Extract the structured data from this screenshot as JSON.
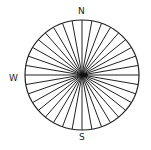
{
  "diagram": {
    "type": "compass-radial-lines",
    "labels": {
      "north": "N",
      "west": "W",
      "south": "S"
    },
    "circle": {
      "cx": 82,
      "cy": 75,
      "rx": 57,
      "ry": 55
    },
    "spoke_count": 36,
    "stroke_color": "#222222",
    "background": "#ffffff"
  }
}
